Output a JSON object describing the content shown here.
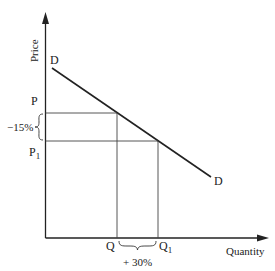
{
  "diagram": {
    "type": "supply-demand",
    "title": "",
    "axes": {
      "y_label": "Price",
      "x_label": "Quantity"
    },
    "curve": {
      "name": "Demand",
      "start_label": "D",
      "end_label": "D"
    },
    "price_levels": [
      {
        "label": "P",
        "subscript": ""
      },
      {
        "label": "P",
        "subscript": "1"
      }
    ],
    "quantity_levels": [
      {
        "label": "Q",
        "subscript": ""
      },
      {
        "label": "Q",
        "subscript": "1"
      }
    ],
    "annotations": {
      "price_change": "−15%",
      "quantity_change": "+ 30%"
    },
    "colors": {
      "line": "#222222",
      "background": "#ffffff"
    }
  }
}
